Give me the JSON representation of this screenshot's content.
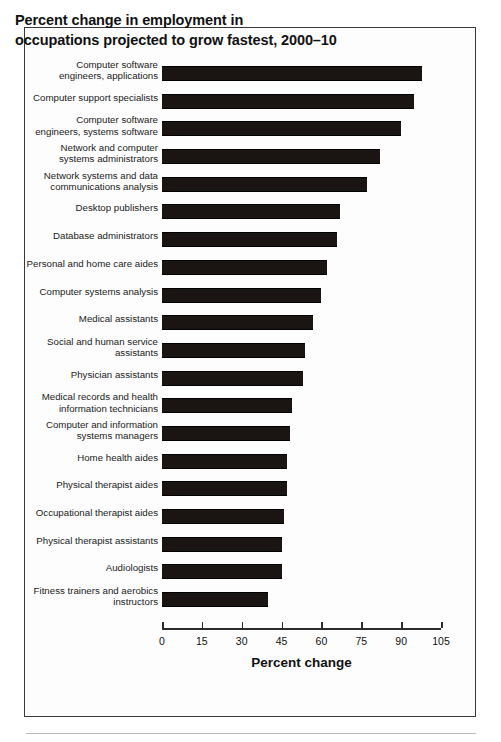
{
  "figure": {
    "title_lines": [
      "Percent change in employment in",
      "occupations projected to grow fastest, 2000–10"
    ],
    "bar_color": "#1a1512",
    "axis_color": "#2b2b2b",
    "frame_color": "#3a3a3a"
  },
  "chart_data": {
    "type": "bar",
    "orientation": "horizontal",
    "title": "Percent change in employment in occupations projected to grow fastest, 2000–10",
    "xlabel": "Percent change",
    "ylabel": "",
    "xlim": [
      0,
      105
    ],
    "xticks": [
      0,
      15,
      30,
      45,
      60,
      75,
      90,
      105
    ],
    "xtick_labels": [
      "0",
      "15",
      "30",
      "45",
      "60",
      "75",
      "90",
      "105"
    ],
    "grid": false,
    "legend": null,
    "categories": [
      "Computer software engineers, applications",
      "Computer support specialists",
      "Computer software engineers, systems software",
      "Network and computer systems administrators",
      "Network systems and data communications analysis",
      "Desktop publishers",
      "Database administrators",
      "Personal and home care aides",
      "Computer systems analysis",
      "Medical assistants",
      "Social and human service assistants",
      "Physician assistants",
      "Medical records and health information technicians",
      "Computer and information systems managers",
      "Home health aides",
      "Physical therapist aides",
      "Occupational therapist aides",
      "Physical therapist assistants",
      "Audiologists",
      "Fitness trainers and aerobics instructors"
    ],
    "category_label_lines": [
      [
        "Computer software",
        "engineers, applications"
      ],
      [
        "Computer support specialists"
      ],
      [
        "Computer software",
        "engineers, systems software"
      ],
      [
        "Network and computer",
        "systems administrators"
      ],
      [
        "Network systems and data",
        "communications analysis"
      ],
      [
        "Desktop publishers"
      ],
      [
        "Database administrators"
      ],
      [
        "Personal and home care aides"
      ],
      [
        "Computer systems analysis"
      ],
      [
        "Medical assistants"
      ],
      [
        "Social and human service",
        "assistants"
      ],
      [
        "Physician assistants"
      ],
      [
        "Medical records and health",
        "information technicians"
      ],
      [
        "Computer and information",
        "systems managers"
      ],
      [
        "Home health aides"
      ],
      [
        "Physical therapist aides"
      ],
      [
        "Occupational therapist aides"
      ],
      [
        "Physical therapist assistants"
      ],
      [
        "Audiologists"
      ],
      [
        "Fitness trainers and aerobics",
        "instructors"
      ]
    ],
    "values": [
      98,
      95,
      90,
      82,
      77,
      67,
      66,
      62,
      60,
      57,
      54,
      53,
      49,
      48,
      47,
      47,
      46,
      45,
      45,
      40
    ]
  }
}
